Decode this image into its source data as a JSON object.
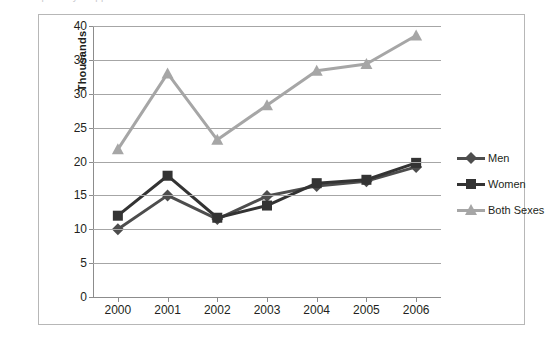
{
  "top_text": "a faint partially cropped line of text above the chart",
  "chart_data": {
    "type": "line",
    "title": "",
    "xlabel": "",
    "ylabel": "Thousands",
    "categories": [
      "2000",
      "2001",
      "2002",
      "2003",
      "2004",
      "2005",
      "2006"
    ],
    "ylim": [
      0,
      40
    ],
    "yticks": [
      "0",
      "5",
      "10",
      "15",
      "20",
      "25",
      "30",
      "35",
      "40"
    ],
    "ytick_values": [
      0,
      5,
      10,
      15,
      20,
      25,
      30,
      35,
      40
    ],
    "grid": true,
    "legend_position": "right",
    "series": [
      {
        "name": "Men",
        "marker": "diamond",
        "color": "#4d4d4d",
        "values": [
          10.0,
          15.0,
          11.5,
          14.9,
          16.4,
          17.1,
          19.2
        ]
      },
      {
        "name": "Women",
        "marker": "square",
        "color": "#333333",
        "values": [
          12.0,
          17.9,
          11.7,
          13.5,
          16.8,
          17.3,
          19.8
        ]
      },
      {
        "name": "Both Sexes",
        "marker": "triangle",
        "color": "#a6a6a6",
        "values": [
          21.8,
          33.0,
          23.2,
          28.3,
          33.4,
          34.4,
          38.6
        ]
      }
    ]
  },
  "legend": {
    "items": [
      {
        "label": "Men"
      },
      {
        "label": "Women"
      },
      {
        "label": "Both Sexes"
      }
    ]
  },
  "colors": {
    "frame": "#b7b7b7",
    "gridline": "#a6a6a6",
    "axis": "#8c8c8c",
    "men": "#4d4d4d",
    "women": "#333333",
    "both": "#a6a6a6",
    "text": "#231f20",
    "background": "#ffffff"
  }
}
